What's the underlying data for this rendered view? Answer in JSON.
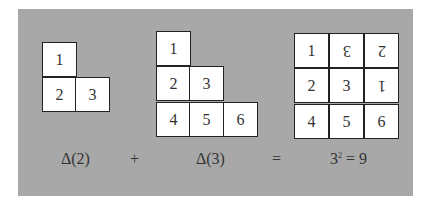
{
  "panel_color": "#a8a8a8",
  "delta2": {
    "cells": [
      "1",
      "2",
      "3"
    ]
  },
  "delta3": {
    "cells": [
      "1",
      "2",
      "3",
      "4",
      "5",
      "6"
    ]
  },
  "square": {
    "cells": [
      "1",
      "3",
      "2",
      "2",
      "3",
      "1",
      "4",
      "5",
      "6"
    ],
    "flipped": [
      false,
      true,
      true,
      false,
      false,
      true,
      false,
      false,
      false
    ]
  },
  "equation": {
    "term1": "Δ(2)",
    "plus": "+",
    "term2": "Δ(3)",
    "equals": "=",
    "result_base": "3",
    "result_exp": "2",
    "result_tail": " = 9"
  }
}
